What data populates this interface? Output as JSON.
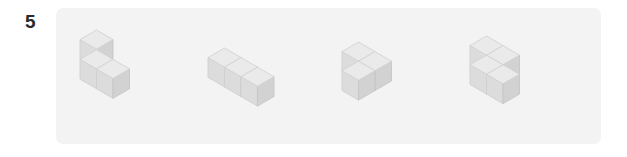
{
  "question": {
    "number": "5"
  },
  "panel": {
    "background_color": "#f3f3f3",
    "page_background_color": "#ffffff"
  },
  "cube_style": {
    "top_face_color": "#eaeaea",
    "left_face_color": "#dcdcdc",
    "right_face_color": "#d2d2d2",
    "outline_color": "#d0d0d0"
  },
  "figures": [
    {
      "name": "figure-1",
      "label": "L-tromino upright",
      "cube_count": 3,
      "cubes": [
        {
          "x": 0,
          "y": 0,
          "z": 0
        },
        {
          "x": 0,
          "y": 1,
          "z": 0
        },
        {
          "x": 1,
          "y": 0,
          "z": 0
        }
      ],
      "origin_x": 78,
      "origin_y": 28,
      "cube_size": 33
    },
    {
      "name": "figure-2",
      "label": "I-tromino row of three",
      "cube_count": 3,
      "cubes": [
        {
          "x": 0,
          "y": 0,
          "z": 0
        },
        {
          "x": 1,
          "y": 0,
          "z": 0
        },
        {
          "x": 2,
          "y": 0,
          "z": 0
        }
      ],
      "origin_x": 206,
      "origin_y": 46,
      "cube_size": 33
    },
    {
      "name": "figure-3",
      "label": "L-tromino flat",
      "cube_count": 3,
      "cubes": [
        {
          "x": 0,
          "y": 0,
          "z": 0
        },
        {
          "x": 1,
          "y": 0,
          "z": 0
        },
        {
          "x": 1,
          "y": 0,
          "z": 1
        }
      ],
      "origin_x": 340,
      "origin_y": 40,
      "cube_size": 33
    },
    {
      "name": "figure-4",
      "label": "four-cube S shape",
      "cube_count": 4,
      "cubes": [
        {
          "x": 0,
          "y": 0,
          "z": 0
        },
        {
          "x": 1,
          "y": 0,
          "z": 0
        },
        {
          "x": 1,
          "y": 0,
          "z": 1
        },
        {
          "x": 2,
          "y": 0,
          "z": 1
        }
      ],
      "origin_x": 468,
      "origin_y": 34,
      "cube_size": 33
    }
  ]
}
